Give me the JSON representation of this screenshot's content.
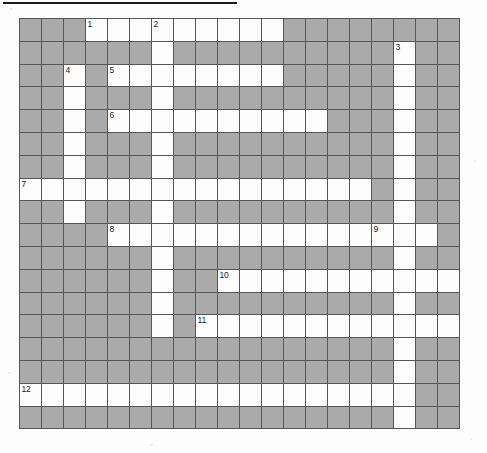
{
  "document": {
    "type": "crossword-puzzle-grid",
    "title": "",
    "has_top_rule": true
  },
  "grid": {
    "columns": 20,
    "rows": 18,
    "cell_size_px": 22,
    "colors": {
      "white_cell": "#fdfdfd",
      "block_cell": "#aaaaaa",
      "cell_border": "#575757",
      "grid_border": "#3b3b3b",
      "number_text": "#222222",
      "page_background": "#fdfdfd",
      "top_rule": "#1c1c1c"
    },
    "legend": {
      "0": "block",
      "1": "white"
    },
    "cells": [
      [
        0,
        0,
        0,
        1,
        1,
        1,
        1,
        1,
        1,
        1,
        1,
        1,
        0,
        0,
        0,
        0,
        0,
        0,
        0,
        0
      ],
      [
        0,
        0,
        0,
        0,
        0,
        0,
        1,
        0,
        0,
        0,
        0,
        0,
        0,
        0,
        0,
        0,
        0,
        1,
        0,
        0
      ],
      [
        0,
        0,
        1,
        0,
        1,
        1,
        1,
        1,
        1,
        1,
        1,
        1,
        0,
        0,
        0,
        0,
        0,
        1,
        0,
        0
      ],
      [
        0,
        0,
        1,
        0,
        0,
        0,
        1,
        0,
        0,
        0,
        0,
        0,
        0,
        0,
        0,
        0,
        0,
        1,
        0,
        0
      ],
      [
        0,
        0,
        1,
        0,
        1,
        1,
        1,
        1,
        1,
        1,
        1,
        1,
        1,
        1,
        0,
        0,
        0,
        1,
        0,
        0
      ],
      [
        0,
        0,
        1,
        0,
        0,
        0,
        1,
        0,
        0,
        0,
        0,
        0,
        0,
        0,
        0,
        0,
        0,
        1,
        0,
        0
      ],
      [
        0,
        0,
        1,
        0,
        0,
        0,
        1,
        0,
        0,
        0,
        0,
        0,
        0,
        0,
        0,
        0,
        0,
        1,
        0,
        0
      ],
      [
        1,
        1,
        1,
        1,
        1,
        1,
        1,
        1,
        1,
        1,
        1,
        1,
        1,
        1,
        1,
        1,
        0,
        1,
        0,
        0
      ],
      [
        0,
        0,
        1,
        0,
        0,
        0,
        1,
        0,
        0,
        0,
        0,
        0,
        0,
        0,
        0,
        0,
        0,
        1,
        0,
        0
      ],
      [
        0,
        0,
        0,
        0,
        1,
        1,
        1,
        1,
        1,
        1,
        1,
        1,
        1,
        1,
        1,
        1,
        1,
        1,
        1,
        0
      ],
      [
        0,
        0,
        0,
        0,
        0,
        0,
        1,
        0,
        0,
        0,
        0,
        0,
        0,
        0,
        0,
        0,
        0,
        1,
        0,
        0
      ],
      [
        0,
        0,
        0,
        0,
        0,
        0,
        1,
        0,
        0,
        1,
        1,
        1,
        1,
        1,
        1,
        1,
        1,
        1,
        1,
        1
      ],
      [
        0,
        0,
        0,
        0,
        0,
        0,
        1,
        0,
        0,
        0,
        0,
        0,
        0,
        0,
        0,
        0,
        0,
        1,
        0,
        0
      ],
      [
        0,
        0,
        0,
        0,
        0,
        0,
        1,
        0,
        1,
        1,
        1,
        1,
        1,
        1,
        1,
        1,
        1,
        1,
        1,
        1
      ],
      [
        0,
        0,
        0,
        0,
        0,
        0,
        0,
        0,
        0,
        0,
        0,
        0,
        0,
        0,
        0,
        0,
        0,
        1,
        0,
        0
      ],
      [
        0,
        0,
        0,
        0,
        0,
        0,
        0,
        0,
        0,
        0,
        0,
        0,
        0,
        0,
        0,
        0,
        0,
        1,
        0,
        0
      ],
      [
        1,
        1,
        1,
        1,
        1,
        1,
        1,
        1,
        1,
        1,
        1,
        1,
        1,
        1,
        1,
        1,
        1,
        1,
        0,
        0
      ],
      [
        0,
        0,
        0,
        0,
        0,
        0,
        0,
        0,
        0,
        0,
        0,
        0,
        0,
        0,
        0,
        0,
        0,
        1,
        0,
        0
      ]
    ],
    "numbers": [
      {
        "label": "1",
        "row": 0,
        "col": 3
      },
      {
        "label": "2",
        "row": 0,
        "col": 6
      },
      {
        "label": "3",
        "row": 1,
        "col": 17
      },
      {
        "label": "4",
        "row": 2,
        "col": 2
      },
      {
        "label": "5",
        "row": 2,
        "col": 4
      },
      {
        "label": "6",
        "row": 4,
        "col": 4
      },
      {
        "label": "7",
        "row": 7,
        "col": 0
      },
      {
        "label": "8",
        "row": 9,
        "col": 4
      },
      {
        "label": "9",
        "row": 9,
        "col": 16
      },
      {
        "label": "10",
        "row": 11,
        "col": 9
      },
      {
        "label": "11",
        "row": 13,
        "col": 8
      },
      {
        "label": "12",
        "row": 16,
        "col": 0
      }
    ]
  }
}
